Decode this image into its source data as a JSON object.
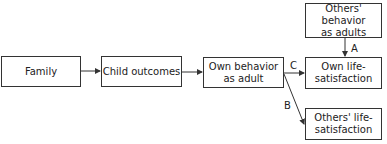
{
  "diagram": {
    "nodes": {
      "family": "Family",
      "child_outcomes": "Child outcomes",
      "own_behavior_1": "Own behavior",
      "own_behavior_2": "as adult",
      "others_behavior_1": "Others' behavior",
      "others_behavior_2": "as adults",
      "own_ls_1": "Own life-",
      "own_ls_2": "satisfaction",
      "others_ls_1": "Others' life-",
      "others_ls_2": "satisfaction"
    },
    "edge_labels": {
      "a": "A",
      "b": "B",
      "c": "C"
    },
    "edges": [
      {
        "from": "Family",
        "to": "Child outcomes"
      },
      {
        "from": "Child outcomes",
        "to": "Own behavior as adult"
      },
      {
        "from": "Own behavior as adult",
        "to": "Own life-satisfaction",
        "label": "C"
      },
      {
        "from": "Own behavior as adult",
        "to": "Others' life-satisfaction",
        "label": "B"
      },
      {
        "from": "Others' behavior as adults",
        "to": "Own life-satisfaction",
        "label": "A"
      }
    ]
  }
}
